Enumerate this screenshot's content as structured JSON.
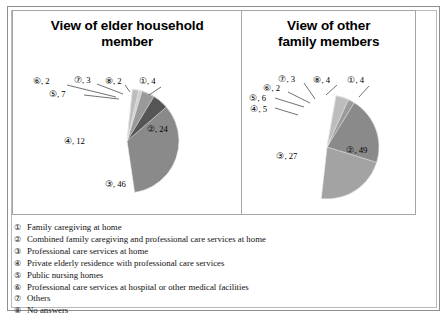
{
  "chart_data": [
    {
      "type": "pie",
      "title": "View of elder household member",
      "categories": [
        "①",
        "②",
        "③",
        "④",
        "⑤",
        "⑥",
        "⑦",
        "⑧"
      ],
      "labels": [
        "①, 4",
        "②, 24",
        "③, 46",
        "④, 12",
        "⑤, 7",
        "⑥, 2",
        "⑦, 3",
        "⑧, 2"
      ],
      "values": [
        4,
        24,
        46,
        12,
        7,
        2,
        3,
        2
      ],
      "colors": [
        "#6e6e6e",
        "#a3a3a3",
        "#8a8a8a",
        "#555555",
        "#9a9a9a",
        "#777777",
        "#cfcfcf",
        "#bdbdbd"
      ],
      "legend_position": "below-both",
      "grid": false
    },
    {
      "type": "pie",
      "title": "View of other family members",
      "categories": [
        "①",
        "②",
        "③",
        "④",
        "⑤",
        "⑥",
        "⑦",
        "⑧"
      ],
      "labels": [
        "①, 4",
        "②, 49",
        "③, 27",
        "④, 5",
        "⑤, 6",
        "⑥, 2",
        "⑦, 3",
        "⑧, 4"
      ],
      "values": [
        4,
        49,
        27,
        5,
        6,
        2,
        3,
        4
      ],
      "colors": [
        "#6e6e6e",
        "#a3a3a3",
        "#8a8a8a",
        "#555555",
        "#9a9a9a",
        "#777777",
        "#cfcfcf",
        "#bdbdbd"
      ],
      "legend_position": "below-both",
      "grid": false
    }
  ],
  "panels": {
    "left": {
      "title_line1": "View of elder household",
      "title_line2": "member",
      "callouts": [
        {
          "text": "⑥, 2"
        },
        {
          "text": "⑦, 3"
        },
        {
          "text": "⑧, 2"
        },
        {
          "text": "①, 4"
        },
        {
          "text": "⑤, 7"
        }
      ],
      "inner": [
        {
          "text": "②, 24"
        },
        {
          "text": "④, 12"
        },
        {
          "text": "③, 46"
        }
      ]
    },
    "right": {
      "title_line1": "View of other",
      "title_line2": "family members",
      "callouts": [
        {
          "text": "⑦, 3"
        },
        {
          "text": "⑧, 4"
        },
        {
          "text": "①, 4"
        },
        {
          "text": "⑥, 2"
        },
        {
          "text": "⑤, 6"
        },
        {
          "text": "④, 5"
        }
      ],
      "inner": [
        {
          "text": "②, 49"
        },
        {
          "text": "③, 27"
        }
      ]
    }
  },
  "legend": {
    "items": [
      {
        "num": "①",
        "text": "Family caregiving at home"
      },
      {
        "num": "②",
        "text": "Combined family caregiving and professional care services at home"
      },
      {
        "num": "③",
        "text": "Professional care services at home"
      },
      {
        "num": "④",
        "text": "Private elderly residence with professional care services"
      },
      {
        "num": "⑤",
        "text": "Public nursing homes"
      },
      {
        "num": "⑥",
        "text": "Professional care services at hospital or other medical facilities"
      },
      {
        "num": "⑦",
        "text": "Others"
      },
      {
        "num": "⑧",
        "text": "No answers"
      }
    ]
  }
}
